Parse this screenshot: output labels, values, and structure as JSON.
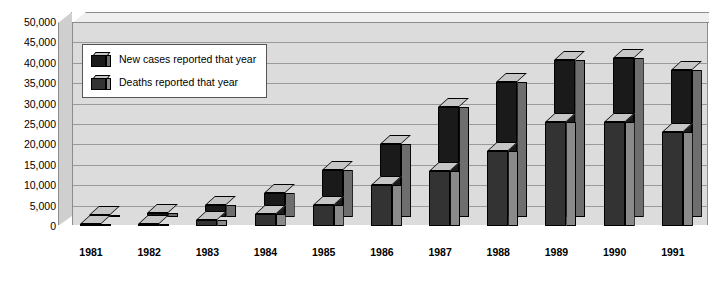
{
  "chart_data": {
    "type": "bar",
    "title": "",
    "xlabel": "",
    "ylabel": "",
    "ylim": [
      0,
      50000
    ],
    "grid": true,
    "legend_position": "top-left",
    "style": "3d-clustered-column",
    "categories": [
      "1981",
      "1982",
      "1983",
      "1984",
      "1985",
      "1986",
      "1987",
      "1988",
      "1989",
      "1990",
      "1991"
    ],
    "ytick_labels": [
      "50,000",
      "45,000",
      "40,000",
      "35,000",
      "30,000",
      "25,000",
      "20,000",
      "15,000",
      "10,000",
      "5,000",
      "0"
    ],
    "ytick_values": [
      50000,
      45000,
      40000,
      35000,
      30000,
      25000,
      20000,
      15000,
      10000,
      5000,
      0
    ],
    "series": [
      {
        "name": "New cases reported that year",
        "color": "#1a1a1a",
        "values": [
          300,
          1000,
          3000,
          6000,
          11500,
          18000,
          27000,
          33000,
          38500,
          39000,
          36000
        ]
      },
      {
        "name": "Deaths reported that year",
        "color": "#333333",
        "values": [
          150,
          500,
          1500,
          3000,
          5200,
          10000,
          13500,
          18500,
          25500,
          25500,
          23000
        ]
      }
    ]
  },
  "legend": {
    "items": [
      {
        "label": "New cases reported that year",
        "swatch": "cases-swatch-icon"
      },
      {
        "label": "Deaths reported that year",
        "swatch": "deaths-swatch-icon"
      }
    ]
  },
  "colors": {
    "new_cases": "#1a1a1a",
    "deaths": "#333333",
    "bar_top": "#c6c6c6",
    "plot_wall": "#dcdcdc",
    "gridline": "#9a9a9a",
    "floor": "#ffffff",
    "axis_text": "#000000"
  }
}
